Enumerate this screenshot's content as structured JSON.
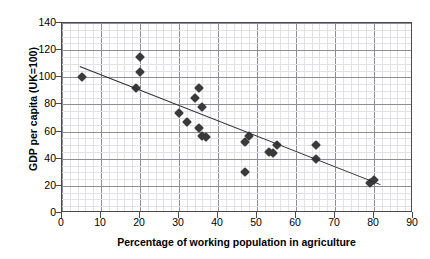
{
  "chart_data": {
    "type": "scatter",
    "title": "",
    "xlabel": "Percentage of working population in agriculture",
    "ylabel": "GDP per capita (UK=100)",
    "xlim": [
      0,
      90
    ],
    "ylim": [
      0,
      140
    ],
    "x_ticks": [
      0,
      10,
      20,
      30,
      40,
      50,
      60,
      70,
      80,
      90
    ],
    "y_ticks": [
      0,
      20,
      40,
      60,
      80,
      100,
      120,
      140
    ],
    "x_minor_step": 2,
    "y_minor_step": 5,
    "grid": true,
    "legend": "none",
    "marker": "diamond",
    "marker_color": "#3a3a3a",
    "trendline": {
      "visible": true,
      "color": "#2b2b2b",
      "x_start": 4.5,
      "y_start": 108,
      "x_end": 81.5,
      "y_end": 21
    },
    "points": [
      {
        "x": 5,
        "y": 100
      },
      {
        "x": 20,
        "y": 115
      },
      {
        "x": 20,
        "y": 104
      },
      {
        "x": 19,
        "y": 92
      },
      {
        "x": 30,
        "y": 74
      },
      {
        "x": 32,
        "y": 67
      },
      {
        "x": 34,
        "y": 85
      },
      {
        "x": 35,
        "y": 92
      },
      {
        "x": 35,
        "y": 63
      },
      {
        "x": 36,
        "y": 78
      },
      {
        "x": 36,
        "y": 57
      },
      {
        "x": 37,
        "y": 56
      },
      {
        "x": 47,
        "y": 30
      },
      {
        "x": 47,
        "y": 52
      },
      {
        "x": 48,
        "y": 57
      },
      {
        "x": 53,
        "y": 45
      },
      {
        "x": 54,
        "y": 44
      },
      {
        "x": 55,
        "y": 50
      },
      {
        "x": 65,
        "y": 50
      },
      {
        "x": 65,
        "y": 40
      },
      {
        "x": 79,
        "y": 22
      },
      {
        "x": 80,
        "y": 24
      }
    ]
  }
}
